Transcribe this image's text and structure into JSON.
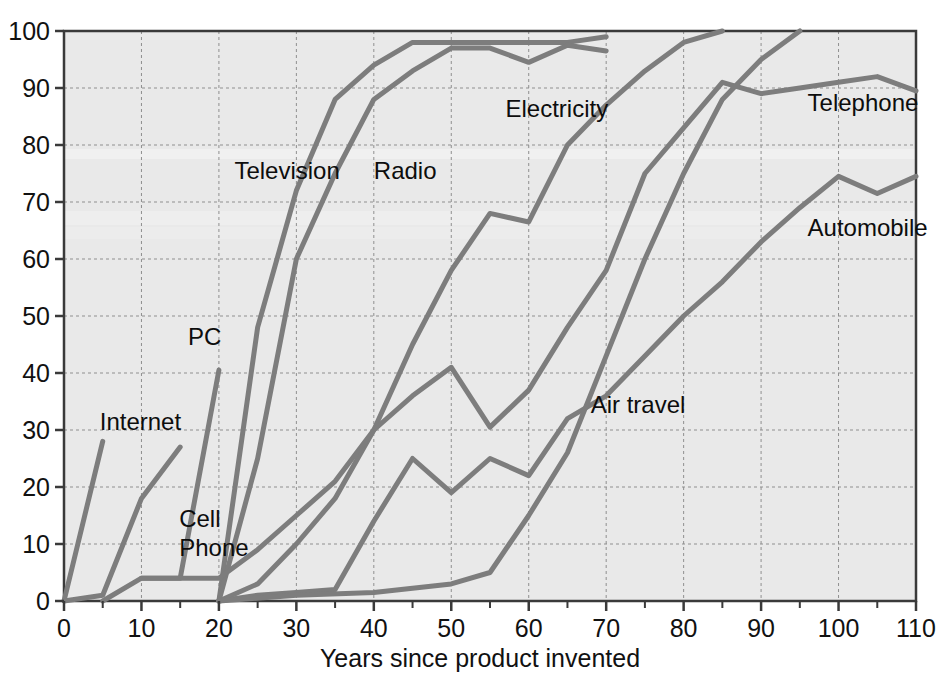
{
  "chart_data": {
    "type": "line",
    "title": "",
    "subtitle": "",
    "xlabel": "Years since product invented",
    "ylabel": "",
    "xlim": [
      0,
      110
    ],
    "ylim": [
      0,
      100
    ],
    "xticks": [
      0,
      10,
      20,
      30,
      40,
      50,
      60,
      70,
      80,
      90,
      100,
      110
    ],
    "xtick_labels": [
      "0",
      "10",
      "20",
      "30",
      "40",
      "50",
      "60",
      "70",
      "80",
      "90",
      "100",
      "110"
    ],
    "yticks": [
      0,
      10,
      20,
      30,
      40,
      50,
      60,
      70,
      80,
      90,
      100
    ],
    "ytick_labels": [
      "0",
      "10",
      "20",
      "30",
      "40",
      "50",
      "60",
      "70",
      "80",
      "90",
      "100"
    ],
    "grid": true,
    "grid_style": "dashed",
    "legend_position": "inline-labels",
    "plot_background": "#e9e9e9",
    "line_color": "#7d7d7d",
    "axis_color": "#3a3a3a",
    "grid_color": "#8f8f8f",
    "line_width": 5,
    "series": [
      {
        "name": "Internet",
        "label": "Internet",
        "label_x": 5,
        "label_y": 30,
        "label_anchor": "start",
        "label_dx": -3,
        "points": [
          [
            0,
            0
          ],
          [
            5,
            28
          ]
        ]
      },
      {
        "name": "Cell Phone",
        "label": "Cell\nPhone",
        "label_x": 15,
        "label_y": 13,
        "label_anchor": "start",
        "label_dx": -1,
        "points": [
          [
            0,
            0
          ],
          [
            5,
            1
          ],
          [
            10,
            18
          ],
          [
            15,
            27
          ]
        ]
      },
      {
        "name": "PC",
        "label": "PC",
        "label_x": 16,
        "label_y": 45,
        "label_anchor": "start",
        "label_dx": 0,
        "points": [
          [
            10,
            4
          ],
          [
            15,
            4
          ],
          [
            20,
            40.5
          ]
        ]
      },
      {
        "name": "Television",
        "label": "Television",
        "label_x": 22,
        "label_y": 74,
        "label_anchor": "start",
        "label_dx": 0,
        "points": [
          [
            20,
            0
          ],
          [
            25,
            48
          ],
          [
            30,
            72
          ],
          [
            35,
            88
          ],
          [
            40,
            94
          ],
          [
            45,
            98
          ],
          [
            50,
            98
          ],
          [
            55,
            98
          ],
          [
            60,
            98
          ],
          [
            65,
            98
          ],
          [
            70,
            99
          ]
        ]
      },
      {
        "name": "Radio",
        "label": "Radio",
        "label_x": 40,
        "label_y": 74,
        "label_anchor": "start",
        "label_dx": 0,
        "points": [
          [
            20,
            0
          ],
          [
            25,
            25
          ],
          [
            30,
            60
          ],
          [
            35,
            75
          ],
          [
            40,
            88
          ],
          [
            45,
            93
          ],
          [
            50,
            97
          ],
          [
            55,
            97
          ],
          [
            60,
            94.5
          ],
          [
            65,
            97.5
          ],
          [
            70,
            96.5
          ]
        ]
      },
      {
        "name": "Electricity",
        "label": "Electricity",
        "label_x": 57,
        "label_y": 85,
        "label_anchor": "start",
        "label_dx": 0,
        "points": [
          [
            20,
            0
          ],
          [
            25,
            3
          ],
          [
            30,
            10
          ],
          [
            35,
            18
          ],
          [
            40,
            30
          ],
          [
            45,
            45
          ],
          [
            50,
            58
          ],
          [
            55,
            68
          ],
          [
            60,
            66.5
          ],
          [
            65,
            80
          ],
          [
            70,
            87
          ],
          [
            75,
            93
          ],
          [
            80,
            98
          ],
          [
            85,
            100
          ]
        ]
      },
      {
        "name": "Telephone",
        "label": "Telephone",
        "label_x": 96,
        "label_y": 86,
        "label_anchor": "start",
        "label_dx": 0,
        "points": [
          [
            5,
            0
          ],
          [
            10,
            4
          ],
          [
            15,
            4
          ],
          [
            20,
            4
          ],
          [
            25,
            9
          ],
          [
            30,
            15
          ],
          [
            35,
            21
          ],
          [
            40,
            30
          ],
          [
            45,
            36
          ],
          [
            50,
            41
          ],
          [
            55,
            30.5
          ],
          [
            60,
            37
          ],
          [
            65,
            48
          ],
          [
            70,
            58
          ],
          [
            75,
            75
          ],
          [
            80,
            83
          ],
          [
            85,
            91
          ],
          [
            90,
            89
          ],
          [
            95,
            90
          ],
          [
            100,
            91
          ],
          [
            105,
            92
          ],
          [
            110,
            89.5
          ]
        ]
      },
      {
        "name": "Automobile",
        "label": "Automobile",
        "label_x": 96,
        "label_y": 64,
        "label_anchor": "start",
        "label_dx": 0,
        "points": [
          [
            20,
            0
          ],
          [
            25,
            1
          ],
          [
            30,
            1.5
          ],
          [
            35,
            2
          ],
          [
            40,
            14
          ],
          [
            45,
            25
          ],
          [
            50,
            19
          ],
          [
            55,
            25
          ],
          [
            60,
            22
          ],
          [
            65,
            32
          ],
          [
            70,
            36
          ],
          [
            75,
            43
          ],
          [
            80,
            50
          ],
          [
            85,
            56
          ],
          [
            90,
            63
          ],
          [
            95,
            69
          ],
          [
            100,
            74.5
          ],
          [
            105,
            71.5
          ],
          [
            110,
            74.5
          ]
        ]
      },
      {
        "name": "Air travel",
        "label": "Air travel",
        "label_x": 68,
        "label_y": 33,
        "label_anchor": "start",
        "label_dx": 0,
        "points": [
          [
            20,
            0
          ],
          [
            30,
            1
          ],
          [
            40,
            1.5
          ],
          [
            50,
            3
          ],
          [
            55,
            5
          ],
          [
            60,
            15
          ],
          [
            65,
            26
          ],
          [
            70,
            43
          ],
          [
            75,
            60
          ],
          [
            80,
            75
          ],
          [
            85,
            88
          ],
          [
            90,
            95
          ],
          [
            95,
            100
          ]
        ]
      }
    ]
  }
}
